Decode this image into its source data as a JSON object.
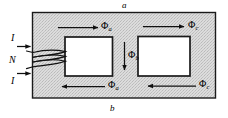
{
  "figure": {
    "nodes": {
      "top_label": "a",
      "bottom_label": "b"
    },
    "coil": {
      "turns_label": "N",
      "current_top_label": "I",
      "current_bottom_label": "I"
    },
    "fluxes": [
      {
        "id": "phi-a-top",
        "symbol": "Φ",
        "subscript": "a",
        "direction": "right"
      },
      {
        "id": "phi-c-top",
        "symbol": "Φ",
        "subscript": "c",
        "direction": "right"
      },
      {
        "id": "phi-b-center",
        "symbol": "Φ",
        "subscript": "b",
        "direction": "down"
      },
      {
        "id": "phi-a-bottom",
        "symbol": "Φ",
        "subscript": "a",
        "direction": "left"
      },
      {
        "id": "phi-c-bottom",
        "symbol": "Φ",
        "subscript": "c",
        "direction": "left"
      }
    ],
    "colors": {
      "core_fill": "#d9d9d9",
      "window_fill": "#ffffff",
      "stroke": "#1a1a1a",
      "background": "#ffffff"
    }
  }
}
